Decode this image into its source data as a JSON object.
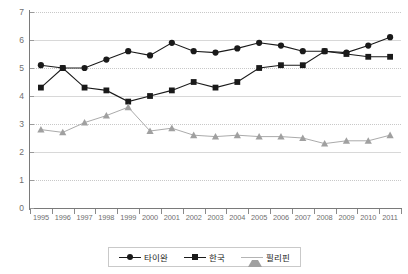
{
  "chart_data": {
    "type": "line",
    "title": "",
    "subtitle": "",
    "xlabel": "",
    "ylabel": "",
    "ylim": [
      0,
      7
    ],
    "ytick_labels": [
      "0",
      "1",
      "2",
      "3",
      "4",
      "5",
      "6",
      "7"
    ],
    "ytick_values": [
      0,
      1,
      2,
      3,
      4,
      5,
      6,
      7
    ],
    "grid": true,
    "grid_axis": "y",
    "legend_position": "bottom-center",
    "categories": [
      "1995",
      "1996",
      "1997",
      "1998",
      "1999",
      "2000",
      "2001",
      "2002",
      "2003",
      "2004",
      "2005",
      "2006",
      "2007",
      "2008",
      "2009",
      "2010",
      "2011"
    ],
    "x": [
      1995,
      1996,
      1997,
      1998,
      1999,
      2000,
      2001,
      2002,
      2003,
      2004,
      2005,
      2006,
      2007,
      2008,
      2009,
      2010,
      2011
    ],
    "series": [
      {
        "name": "타이완",
        "marker": "circle",
        "color": "#1a1a1a",
        "values": [
          5.1,
          5.0,
          5.0,
          5.3,
          5.6,
          5.45,
          5.9,
          5.6,
          5.55,
          5.7,
          5.9,
          5.8,
          5.6,
          5.6,
          5.55,
          5.8,
          6.1
        ]
      },
      {
        "name": "한국",
        "marker": "square",
        "color": "#1a1a1a",
        "values": [
          4.3,
          5.0,
          4.3,
          4.2,
          3.8,
          4.0,
          4.2,
          4.5,
          4.3,
          4.5,
          5.0,
          5.1,
          5.1,
          5.6,
          5.5,
          5.4,
          5.4
        ]
      },
      {
        "name": "필리핀",
        "marker": "triangle",
        "color": "#a0a0a0",
        "values": [
          2.8,
          2.7,
          3.05,
          3.3,
          3.6,
          2.75,
          2.85,
          2.6,
          2.55,
          2.6,
          2.55,
          2.55,
          2.5,
          2.3,
          2.4,
          2.4,
          2.6
        ]
      }
    ]
  },
  "legend": {
    "items": [
      {
        "label": "타이완",
        "marker": "circle-marker",
        "color": "#1a1a1a"
      },
      {
        "label": "한국",
        "marker": "square-marker",
        "color": "#1a1a1a"
      },
      {
        "label": "필리핀",
        "marker": "triangle-marker",
        "color": "#a0a0a0"
      }
    ]
  }
}
